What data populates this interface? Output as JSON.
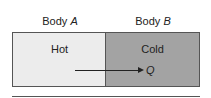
{
  "labels": {
    "body_a_prefix": "Body ",
    "body_a_var": "A",
    "body_b_prefix": "Body ",
    "body_b_var": "B"
  },
  "boxes": {
    "a_text": "Hot",
    "b_text": "Cold"
  },
  "arrow": {
    "label": "Q"
  },
  "colors": {
    "hot": "#ececec",
    "cold": "#a3a3a3"
  }
}
